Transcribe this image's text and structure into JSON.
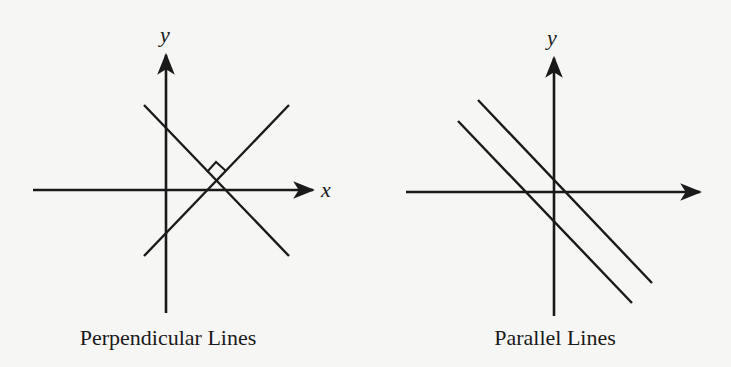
{
  "colors": {
    "background": "#f6f6f4",
    "ink": "#1a1a1a"
  },
  "figures": [
    {
      "id": "perpendicular",
      "caption": "Perpendicular Lines",
      "axes": {
        "x_label": "x",
        "y_label": "y",
        "x_axis": {
          "x1": 33,
          "y1": 190,
          "x2": 313,
          "y2": 190
        },
        "y_axis": {
          "x1": 166,
          "y1": 313,
          "x2": 166,
          "y2": 52
        }
      },
      "lines": [
        {
          "x1": 144,
          "y1": 105,
          "x2": 289,
          "y2": 256
        },
        {
          "x1": 144,
          "y1": 256,
          "x2": 289,
          "y2": 105
        }
      ],
      "right_angle_marker": true
    },
    {
      "id": "parallel",
      "caption": "Parallel Lines",
      "axes": {
        "y_label": "y",
        "x_axis": {
          "x1": 406,
          "y1": 192,
          "x2": 700,
          "y2": 192
        },
        "y_axis": {
          "x1": 554,
          "y1": 316,
          "x2": 554,
          "y2": 55
        }
      },
      "lines": [
        {
          "x1": 478,
          "y1": 100,
          "x2": 652,
          "y2": 283
        },
        {
          "x1": 458,
          "y1": 121,
          "x2": 632,
          "y2": 303
        }
      ]
    }
  ]
}
